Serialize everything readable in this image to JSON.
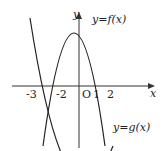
{
  "axes": {
    "x_label": "x",
    "y_label": "y",
    "origin_label": "O"
  },
  "ticks": [
    "-3",
    "-2",
    "1",
    "2"
  ],
  "curves": {
    "f_label": "y=f(x)",
    "g_label": "y=g(x)"
  },
  "colors": {
    "ink": "#222222",
    "background": "#ffffff"
  }
}
